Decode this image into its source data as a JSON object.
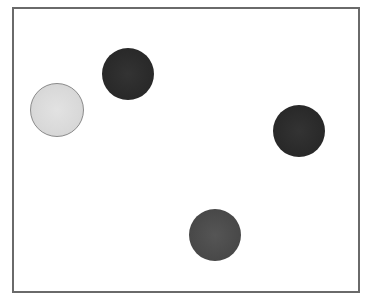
{
  "diagram": {
    "frame": {
      "x": 12,
      "y": 7,
      "width": 348,
      "height": 286,
      "border_color": "#6a6a6a",
      "background": "#ffffff"
    },
    "circles": [
      {
        "id": "light-circle",
        "shade": "light",
        "cx": 57,
        "cy": 110,
        "r": 27,
        "fill": "#d9d9d9",
        "stroke": "#8a8a8a"
      },
      {
        "id": "dark-circle-top",
        "shade": "dark",
        "cx": 128,
        "cy": 74,
        "r": 26,
        "fill": "#2b2b2b"
      },
      {
        "id": "dark-circle-right",
        "shade": "dark",
        "cx": 299,
        "cy": 131,
        "r": 26,
        "fill": "#262626"
      },
      {
        "id": "medium-circle-bottom",
        "shade": "medium",
        "cx": 215,
        "cy": 235,
        "r": 26,
        "fill": "#4a4a4a"
      }
    ],
    "circle_count": 4
  }
}
